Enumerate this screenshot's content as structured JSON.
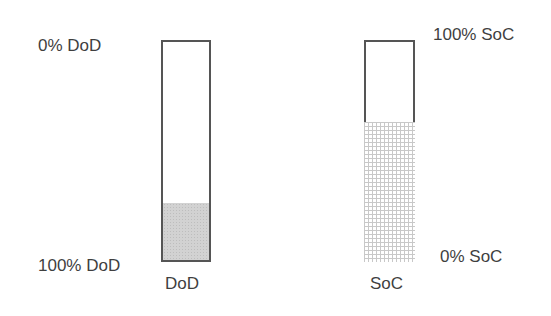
{
  "diagram": {
    "dod": {
      "top_label": "0% DoD",
      "bottom_label": "100% DoD",
      "caption": "DoD",
      "fill_fraction": 0.26,
      "fill_color": "#d2d2d2",
      "border_color": "#555555"
    },
    "soc": {
      "top_label": "100% SoC",
      "bottom_label": "0% SoC",
      "caption": "SoC",
      "fill_fraction": 0.63,
      "fill_pattern": "grid",
      "fill_color": "#c8c8c8",
      "border_color": "#555555"
    }
  }
}
